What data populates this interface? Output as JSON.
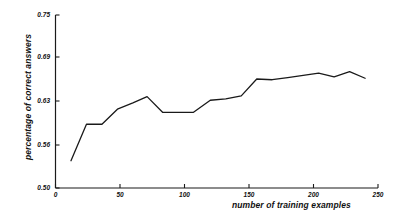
{
  "chart_data": {
    "type": "line",
    "title": "",
    "xlabel": "number of training examples",
    "ylabel": "percentage of correct answers",
    "xlim": [
      0,
      250
    ],
    "ylim": [
      0.5,
      0.75
    ],
    "xticks": [
      0,
      50,
      100,
      150,
      200,
      250
    ],
    "xticklabels": [
      "0",
      "50",
      "100",
      "150",
      "200",
      "250"
    ],
    "yticks": [
      0.5,
      0.56,
      0.63,
      0.69,
      0.75
    ],
    "yticklabels": [
      "0.50",
      "0.56",
      "0.63",
      "0.69",
      "0.75"
    ],
    "grid": false,
    "legend": false,
    "line_color": "#1a1a1a",
    "line_width": 1.3,
    "series": [
      {
        "name": "percentage of correct answers",
        "x": [
          12,
          24,
          36,
          48,
          60,
          71,
          83,
          95,
          107,
          120,
          132,
          144,
          156,
          168,
          180,
          192,
          204,
          216,
          228,
          240
        ],
        "values": [
          0.538,
          0.593,
          0.593,
          0.617,
          0.627,
          0.636,
          0.612,
          0.612,
          0.612,
          0.631,
          0.633,
          0.637,
          0.66,
          0.659,
          0.662,
          0.665,
          0.668,
          0.663,
          0.67,
          0.661
        ]
      }
    ]
  },
  "axes": {
    "spine_color": "#1a1a1a",
    "tick_length": 4
  }
}
